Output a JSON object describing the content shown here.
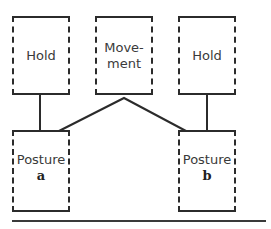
{
  "diagram": {
    "top_row": [
      {
        "id": "hold-1",
        "label": "Hold"
      },
      {
        "id": "movement",
        "label_line1": "Move-",
        "label_line2": "ment"
      },
      {
        "id": "hold-2",
        "label": "Hold"
      }
    ],
    "bottom_row": [
      {
        "id": "posture-a",
        "label": "Posture",
        "sub": "a"
      },
      {
        "id": "posture-b",
        "label": "Posture",
        "sub": "b"
      }
    ],
    "colors": {
      "line": "#2b2b2b",
      "text": "#3a3a3a",
      "background": "#ffffff"
    }
  }
}
